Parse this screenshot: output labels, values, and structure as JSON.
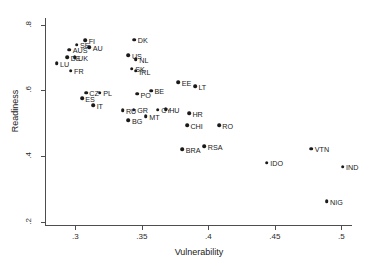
{
  "chart_data": {
    "type": "scatter",
    "title": "",
    "xlabel": "Vulnerability",
    "ylabel": "Readiness",
    "xlim": [
      0.278,
      0.508
    ],
    "ylim": [
      0.19,
      0.82
    ],
    "xticks": [
      ".3",
      ".35",
      ".4",
      ".45",
      ".5"
    ],
    "xtick_values": [
      0.3,
      0.35,
      0.4,
      0.45,
      0.5
    ],
    "yticks": [
      ".8",
      ".6",
      ".4",
      ".2"
    ],
    "ytick_values": [
      0.8,
      0.6,
      0.4,
      0.2
    ],
    "grid": false,
    "legend": "none",
    "marker_color": "#1a1a1a",
    "axis_color": "#4d4d4d",
    "background": "#ffffff",
    "points": [
      {
        "label": "FI",
        "x": 0.3075,
        "y": 0.753
      },
      {
        "label": "SE",
        "x": 0.301,
        "y": 0.7385
      },
      {
        "label": "AU",
        "x": 0.3105,
        "y": 0.732
      },
      {
        "label": "AUS",
        "x": 0.2955,
        "y": 0.7235
      },
      {
        "label": "DE",
        "x": 0.294,
        "y": 0.701
      },
      {
        "label": "UK",
        "x": 0.2995,
        "y": 0.7005
      },
      {
        "label": "LU",
        "x": 0.286,
        "y": 0.683
      },
      {
        "label": "FR",
        "x": 0.2965,
        "y": 0.6595
      },
      {
        "label": "DK",
        "x": 0.3445,
        "y": 0.7545
      },
      {
        "label": "US",
        "x": 0.34,
        "y": 0.706
      },
      {
        "label": "NL",
        "x": 0.3455,
        "y": 0.694
      },
      {
        "label": "SK",
        "x": 0.3425,
        "y": 0.666
      },
      {
        "label": "IRL",
        "x": 0.3455,
        "y": 0.659
      },
      {
        "label": "EE",
        "x": 0.3775,
        "y": 0.6255
      },
      {
        "label": "LT",
        "x": 0.39,
        "y": 0.6125
      },
      {
        "label": "CZ",
        "x": 0.308,
        "y": 0.593
      },
      {
        "label": "PL",
        "x": 0.3185,
        "y": 0.593
      },
      {
        "label": "PO",
        "x": 0.3465,
        "y": 0.589
      },
      {
        "label": "BE",
        "x": 0.357,
        "y": 0.599
      },
      {
        "label": "ES",
        "x": 0.305,
        "y": 0.576
      },
      {
        "label": "IT",
        "x": 0.3135,
        "y": 0.554
      },
      {
        "label": "RU",
        "x": 0.3355,
        "y": 0.5395
      },
      {
        "label": "GR",
        "x": 0.344,
        "y": 0.5415
      },
      {
        "label": "CY",
        "x": 0.362,
        "y": 0.541
      },
      {
        "label": "HU",
        "x": 0.368,
        "y": 0.5425
      },
      {
        "label": "BG",
        "x": 0.34,
        "y": 0.509
      },
      {
        "label": "MT",
        "x": 0.353,
        "y": 0.521
      },
      {
        "label": "HR",
        "x": 0.3855,
        "y": 0.5305
      },
      {
        "label": "CHI",
        "x": 0.384,
        "y": 0.4945
      },
      {
        "label": "RO",
        "x": 0.408,
        "y": 0.493
      },
      {
        "label": "BRA",
        "x": 0.3805,
        "y": 0.42
      },
      {
        "label": "RSA",
        "x": 0.397,
        "y": 0.4305
      },
      {
        "label": "IDO",
        "x": 0.444,
        "y": 0.38
      },
      {
        "label": "VTN",
        "x": 0.4775,
        "y": 0.422
      },
      {
        "label": "IND",
        "x": 0.501,
        "y": 0.3675
      },
      {
        "label": "NIG",
        "x": 0.489,
        "y": 0.262
      }
    ]
  }
}
